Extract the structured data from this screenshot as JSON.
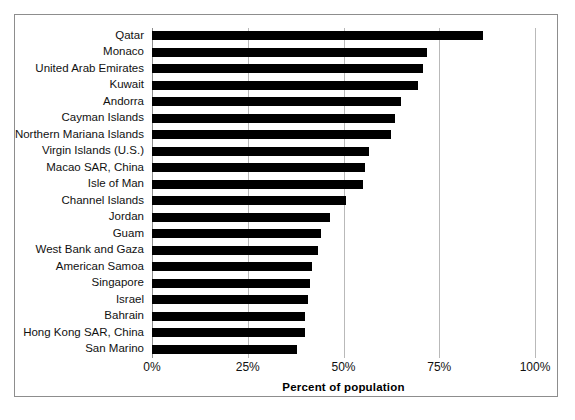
{
  "chart_data": {
    "type": "bar",
    "orientation": "horizontal",
    "title": "",
    "xlabel": "Percent of population",
    "ylabel": "",
    "xlim": [
      0,
      100
    ],
    "xticks": [
      "0%",
      "25%",
      "50%",
      "75%",
      "100%"
    ],
    "xtick_values": [
      0,
      25,
      50,
      75,
      100
    ],
    "grid": "vertical",
    "legend": "none",
    "bar_color": "#000000",
    "categories": [
      "Qatar",
      "Monaco",
      "United Arab Emirates",
      "Kuwait",
      "Andorra",
      "Cayman Islands",
      "Northern Mariana Islands",
      "Virgin Islands (U.S.)",
      "Macao SAR, China",
      "Isle of Man",
      "Channel Islands",
      "Jordan",
      "Guam",
      "West Bank and Gaza",
      "American Samoa",
      "Singapore",
      "Israel",
      "Bahrain",
      "Hong Kong SAR, China",
      "San Marino"
    ],
    "values": [
      86.4,
      71.8,
      70.8,
      69.5,
      65.0,
      63.4,
      62.4,
      56.7,
      55.6,
      55.1,
      50.7,
      46.5,
      44.1,
      43.3,
      41.8,
      41.3,
      40.7,
      39.9,
      39.9,
      37.9
    ]
  }
}
